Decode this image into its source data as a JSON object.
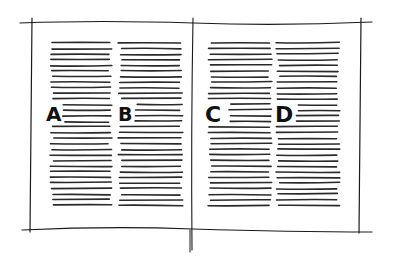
{
  "diagram": {
    "labels": {
      "a": "A",
      "b": "B",
      "c": "C",
      "d": "D"
    },
    "colors": {
      "ink": "#1a1a1a",
      "paper": "#ffffff"
    },
    "pages": [
      {
        "name": "left-page",
        "columns": [
          "A",
          "B"
        ]
      },
      {
        "name": "right-page",
        "columns": [
          "C",
          "D"
        ]
      }
    ]
  }
}
